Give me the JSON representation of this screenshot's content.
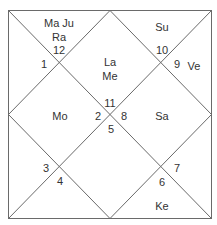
{
  "chart": {
    "type": "north-indian-birth-chart",
    "houses": [
      {
        "num": "1",
        "planets": ""
      },
      {
        "num": "2",
        "planets": "Mo"
      },
      {
        "num": "3",
        "planets": ""
      },
      {
        "num": "4",
        "planets": ""
      },
      {
        "num": "5",
        "planets": ""
      },
      {
        "num": "6",
        "planets": "Ke"
      },
      {
        "num": "7",
        "planets": ""
      },
      {
        "num": "8",
        "planets": "Sa"
      },
      {
        "num": "9",
        "planets": "Ve"
      },
      {
        "num": "10",
        "planets": "Su"
      },
      {
        "num": "11",
        "planets": "La Me"
      },
      {
        "num": "12",
        "planets": "Ma Ju Ra"
      }
    ],
    "labels": {
      "top_left_line1": "Ma Ju",
      "top_left_line2": "Ra",
      "center_top_line1": "La",
      "center_top_line2": "Me",
      "top_right": "Su",
      "right": "Ve",
      "left": "Mo",
      "center_right": "Sa",
      "bottom_right": "Ke"
    },
    "numbers": {
      "n1": "1",
      "n2": "2",
      "n3": "3",
      "n4": "4",
      "n5": "5",
      "n6": "6",
      "n7": "7",
      "n8": "8",
      "n9": "9",
      "n10": "10",
      "n11": "11",
      "n12": "12"
    }
  }
}
